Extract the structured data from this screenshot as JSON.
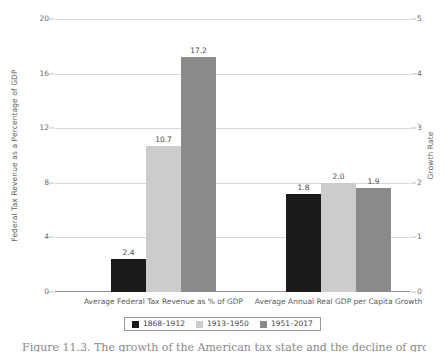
{
  "chart_data": {
    "type": "bar",
    "title": "",
    "categories": [
      "Average Federal Tax Revenue as % of GDP",
      "Average Annual Real GDP per Capita Growth"
    ],
    "series": [
      {
        "name": "1868–1912",
        "color": "#1a1a1a",
        "values": [
          2.4,
          1.8
        ]
      },
      {
        "name": "1913–1950",
        "color": "#cccccc",
        "values": [
          10.7,
          2.0
        ]
      },
      {
        "name": "1951–2017",
        "color": "#8a8a8a",
        "values": [
          17.2,
          1.9
        ]
      }
    ],
    "value_labels": [
      [
        "2.4",
        "10.7",
        "17.2"
      ],
      [
        "1.8",
        "2.0",
        "1.9"
      ]
    ],
    "axes": {
      "left": {
        "label": "Federal Tax Revenue as a Percentage of GDP",
        "ticks": [
          "20",
          "16",
          "12",
          "8",
          "4",
          "0"
        ],
        "tick_values": [
          20,
          16,
          12,
          8,
          4,
          0
        ],
        "range": [
          0,
          20
        ],
        "applies_to_category": 0
      },
      "right": {
        "label": "Growth Rate",
        "ticks": [
          "5",
          "4",
          "3",
          "2",
          "1",
          "0"
        ],
        "tick_values": [
          5,
          4,
          3,
          2,
          1,
          0
        ],
        "range": [
          0,
          5
        ],
        "applies_to_category": 1
      }
    },
    "grid": true,
    "legend_position": "bottom",
    "xlabel": "",
    "ylabel": "Federal Tax Revenue as a Percentage of GDP"
  },
  "legend": {
    "items": [
      {
        "label": "1868–1912",
        "color": "#1a1a1a"
      },
      {
        "label": "1913–1950",
        "color": "#cccccc"
      },
      {
        "label": "1951–2017",
        "color": "#8a8a8a"
      }
    ]
  },
  "caption": {
    "text": "Figure 11.3. The growth of the American tax state and the decline of growth."
  }
}
